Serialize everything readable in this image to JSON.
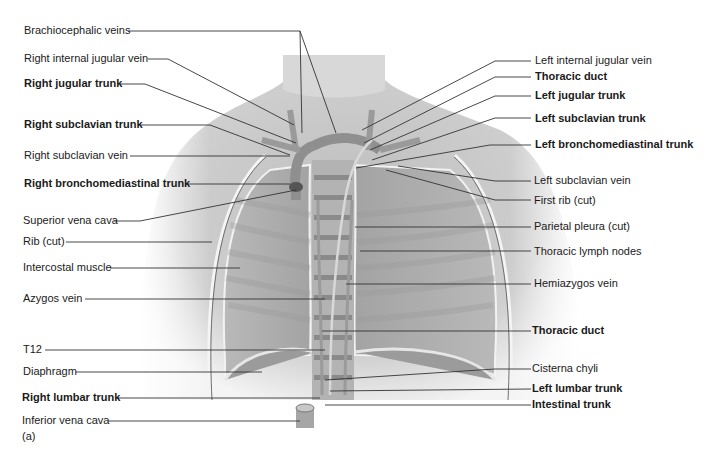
{
  "figure": {
    "panel_label": "(a)",
    "colors": {
      "background": "#ffffff",
      "skin_light": "#ececec",
      "skin_mid": "#c8c8c8",
      "lung": "#a9a9a9",
      "vessel": "#8f8f8f",
      "leader_line": "#333333",
      "text": "#1a1a1a"
    },
    "left_labels": [
      {
        "text": "Brachiocephalic veins",
        "bold": false
      },
      {
        "text": "Right internal jugular vein",
        "bold": false
      },
      {
        "text": "Right jugular trunk",
        "bold": true
      },
      {
        "text": "Right subclavian trunk",
        "bold": true
      },
      {
        "text": "Right subclavian vein",
        "bold": false
      },
      {
        "text": "Right bronchomediastinal trunk",
        "bold": true
      },
      {
        "text": "Superior vena cava",
        "bold": false
      },
      {
        "text": "Rib (cut)",
        "bold": false
      },
      {
        "text": "Intercostal muscle",
        "bold": false
      },
      {
        "text": "Azygos vein",
        "bold": false
      },
      {
        "text": "T12",
        "bold": false
      },
      {
        "text": "Diaphragm",
        "bold": false
      },
      {
        "text": "Right lumbar trunk",
        "bold": true
      },
      {
        "text": "Inferior vena cava",
        "bold": false
      }
    ],
    "right_labels": [
      {
        "text": "Left internal jugular vein",
        "bold": false
      },
      {
        "text": "Thoracic duct",
        "bold": true
      },
      {
        "text": "Left jugular trunk",
        "bold": true
      },
      {
        "text": "Left subclavian trunk",
        "bold": true
      },
      {
        "text": "Left bronchomediastinal trunk",
        "bold": true
      },
      {
        "text": "Left subclavian vein",
        "bold": false
      },
      {
        "text": "First rib (cut)",
        "bold": false
      },
      {
        "text": "Parietal pleura (cut)",
        "bold": false
      },
      {
        "text": "Thoracic lymph nodes",
        "bold": false
      },
      {
        "text": "Hemiazygos vein",
        "bold": false
      },
      {
        "text": "Thoracic duct",
        "bold": true
      },
      {
        "text": "Cisterna chyli",
        "bold": false
      },
      {
        "text": "Left lumbar trunk",
        "bold": true
      },
      {
        "text": "Intestinal trunk",
        "bold": true
      }
    ]
  }
}
